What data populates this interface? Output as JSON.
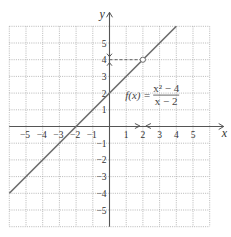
{
  "chart_data": {
    "type": "line",
    "title": "",
    "xlabel": "x",
    "ylabel": "y",
    "xlim": [
      -6,
      6
    ],
    "ylim": [
      -6,
      6
    ],
    "grid": true,
    "x_ticks": [
      -5,
      -4,
      -3,
      -2,
      -1,
      1,
      2,
      3,
      4,
      5
    ],
    "y_ticks": [
      -5,
      -4,
      -3,
      -2,
      -1,
      1,
      2,
      3,
      5
    ],
    "x_tick_labels": [
      "−5",
      "−4",
      "−3",
      "−2",
      "−1",
      "1",
      "2",
      "3",
      "4",
      "5"
    ],
    "y_tick_labels": [
      "−5",
      "−4",
      "−3",
      "−2",
      "−1",
      "1",
      "2",
      "3",
      "5"
    ],
    "y_tick_4_label": "4",
    "series": [
      {
        "name": "f(x) = (x^2 - 4)/(x - 2)",
        "points": [
          [
            -6,
            -4
          ],
          [
            4,
            6
          ]
        ],
        "hole": [
          2,
          4
        ]
      }
    ],
    "annotations": {
      "function_label_prefix": "f(x) =",
      "numerator": "x² − 4",
      "denominator": "x − 2",
      "limit_x": 2,
      "limit_y": 4,
      "approach_arrows": "x→2 from both sides; y→4 from both sides"
    },
    "colors": {
      "line": "#6b6b6b",
      "grid": "#9a9a9a",
      "axis": "#555555",
      "dashed": "#555555"
    }
  }
}
